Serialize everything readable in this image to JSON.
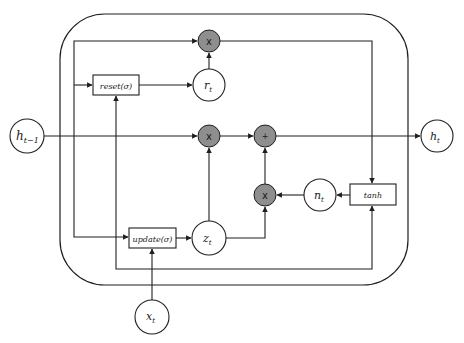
{
  "diagram": {
    "colors": {
      "line": "#1f1f1f",
      "op_fill": "#8e8e8e",
      "node_fill": "#ffffff",
      "background": "#ffffff"
    },
    "inputs": {
      "h_prev": {
        "base": "h",
        "sub": "t−1"
      },
      "x": {
        "base": "x",
        "sub": "t"
      }
    },
    "outputs": {
      "h": {
        "base": "h",
        "sub": "t"
      }
    },
    "gates": {
      "reset": "reset(σ)",
      "update": "update(σ)",
      "candidate": "tanh"
    },
    "states": {
      "r": {
        "base": "r",
        "sub": "t"
      },
      "z": {
        "base": "z",
        "sub": "t"
      },
      "n": {
        "base": "n",
        "sub": "t"
      }
    },
    "operators": {
      "mul_reset": "x",
      "mul_update": "x",
      "mul_candidate": "x",
      "add": "+"
    }
  }
}
